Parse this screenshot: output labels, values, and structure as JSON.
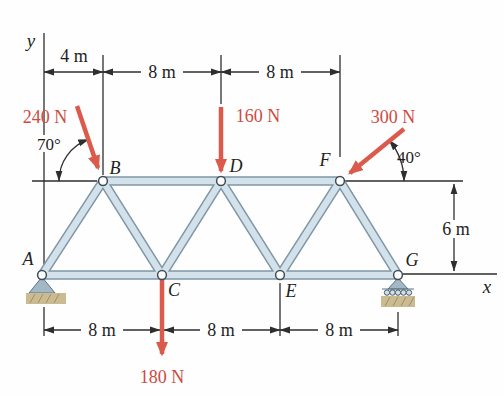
{
  "figure_type": "plane-truss-free-body-diagram",
  "axes": {
    "x_label": "x",
    "y_label": "y"
  },
  "joints": {
    "A": "A",
    "B": "B",
    "C": "C",
    "D": "D",
    "E": "E",
    "F": "F",
    "G": "G"
  },
  "forces": {
    "f240": {
      "label": "240 N",
      "angle": "70°",
      "applied_at": "B"
    },
    "f160": {
      "label": "160 N",
      "applied_at": "D"
    },
    "f300": {
      "label": "300 N",
      "angle": "40°",
      "applied_at": "F"
    },
    "f180": {
      "label": "180 N",
      "applied_at": "C"
    }
  },
  "dimensions": {
    "top_offset": "4 m",
    "top_span_1": "8 m",
    "top_span_2": "8 m",
    "height": "6 m",
    "bottom_span_1": "8 m",
    "bottom_span_2": "8 m",
    "bottom_span_3": "8 m"
  },
  "supports": {
    "A": "pin",
    "G": "roller"
  },
  "colors": {
    "force": "#dc5a4c",
    "force_text": "#cd4b3f",
    "member_fill": "#d3e1ea",
    "member_edge": "#7e96a6",
    "support": "#a3b8c6",
    "ground": "#cbbb92",
    "line": "#2e2e2e"
  }
}
